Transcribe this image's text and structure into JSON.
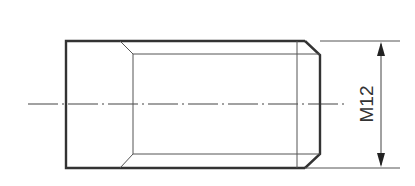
{
  "drawing": {
    "type": "threaded-plug-side-view",
    "dimension": {
      "label": "M12"
    },
    "colors": {
      "stroke": "#333333",
      "thin": "#555555",
      "background": "#ffffff"
    }
  }
}
